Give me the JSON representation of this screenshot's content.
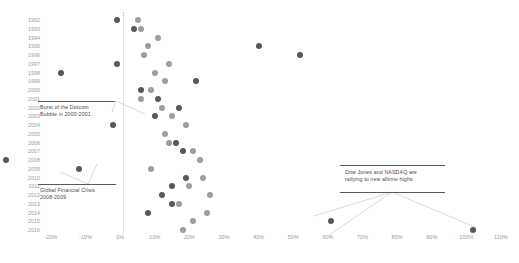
{
  "chart_data": {
    "type": "scatter",
    "title": "",
    "subtitle": "",
    "xlabel": "",
    "ylabel": "",
    "xlim": [
      -20,
      110
    ],
    "ylim_categories": true,
    "grid": false,
    "legend_position": "none",
    "xticks": [
      "-20%",
      "-10%",
      "0%",
      "10%",
      "20%",
      "30%",
      "40%",
      "50%",
      "60%",
      "70%",
      "80%",
      "90%",
      "100%",
      "110%"
    ],
    "xtick_values": [
      -20,
      -10,
      0,
      10,
      20,
      30,
      40,
      50,
      60,
      70,
      80,
      90,
      100,
      110
    ],
    "categories": [
      "1992",
      "1993",
      "1994",
      "1995",
      "1996",
      "1997",
      "1998",
      "1999",
      "2000",
      "2001",
      "2002",
      "2003",
      "2004",
      "2005",
      "2006",
      "2007",
      "2008",
      "2009",
      "2010",
      "2011",
      "2012",
      "2013",
      "2014",
      "2015",
      "2016"
    ],
    "series": [
      {
        "name": "dark-series",
        "color": "#585858",
        "values": [
          -1,
          4,
          null,
          40,
          52,
          -1,
          -17,
          22,
          6,
          11,
          17,
          10,
          -2,
          null,
          16,
          18,
          -33,
          -12,
          19,
          15,
          12,
          15,
          8,
          61,
          102
        ]
      },
      {
        "name": "light-series",
        "color": "#9d9d9d",
        "values": [
          5,
          6,
          11,
          8,
          7,
          14,
          10,
          13,
          9,
          6,
          12,
          15,
          19,
          13,
          14,
          21,
          23,
          9,
          24,
          20,
          26,
          17,
          25,
          21,
          18
        ]
      }
    ],
    "annotations": [
      {
        "name": "dotcom-bubble",
        "text": "Burst of the Dotcom\nBubble in 2000-2001"
      },
      {
        "name": "global-financial-crisis",
        "text": "Global Financial Crisis\n2008-2009"
      },
      {
        "name": "rally-alltime-highs",
        "text": "Dow Jones and NASDAQ are\nrallying to new alltime highs"
      }
    ],
    "zero_reference_line": "0%",
    "colors": {
      "dark_marker": "#585858",
      "light_marker": "#9d9d9d",
      "axis_text": "#9a9a9a",
      "annotation_text": "#4a4a4a",
      "zero_line": "#c9c9c9",
      "background": "#ffffff"
    }
  }
}
